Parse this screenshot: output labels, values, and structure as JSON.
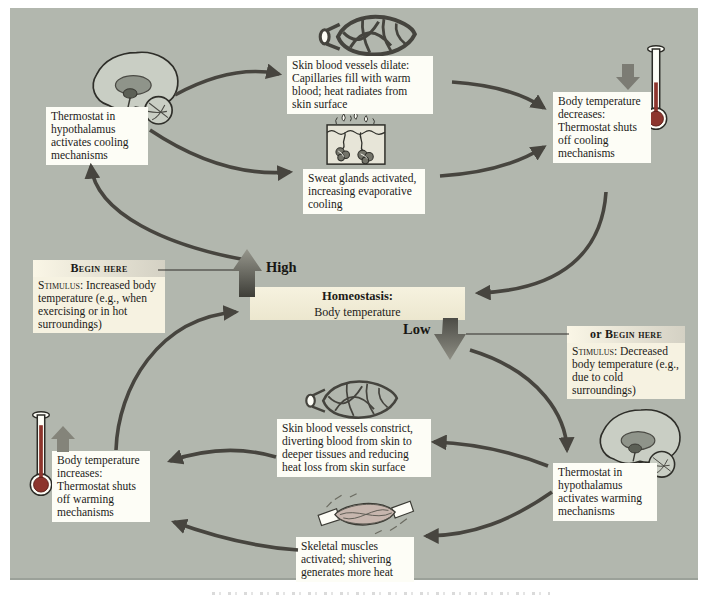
{
  "figure": {
    "topic": "Homeostasis: regulation of body temperature (negative feedback loop)"
  },
  "colors": {
    "panel_bg": "#b2b7ae",
    "white_box_bg": "#fdfdf6",
    "cream_box_bg": "#f6f2e1",
    "curved_arrow": "#47453f",
    "big_arrow_light": "#96968c",
    "big_arrow_dark": "#3e3e38",
    "small_arrow": "#7c7c74",
    "thermometer_mercury": "#8d352d",
    "text": "#1c1b18"
  },
  "nodes": {
    "cooling_thermostat": {
      "text": "Thermostat in hypothalamus activates cooling mechanisms"
    },
    "vessels_dilate": {
      "text": "Skin blood vessels dilate: Capillaries fill with warm blood; heat radiates from skin surface"
    },
    "sweat_glands": {
      "text": "Sweat glands activated, increasing evaporative cooling"
    },
    "temp_decreases": {
      "text": "Body temperature decreases: Thermostat shuts off cooling mechanisms"
    },
    "begin_here": {
      "header": "Begin here",
      "stimulus_label": "Stimulus:",
      "text": " Increased body temperature (e.g., when exercising or in hot surroundings)"
    },
    "homeostasis": {
      "title": "Homeostasis:",
      "subtitle": "Body temperature"
    },
    "high_label": "High",
    "low_label": "Low",
    "or_begin_here": {
      "header_prefix": "or ",
      "header": "Begin here",
      "stimulus_label": "Stimulus:",
      "text": " Decreased body temperature (e.g., due to cold surroundings)"
    },
    "temp_increases": {
      "text": "Body temperature increases: Thermostat shuts off warming mechanisms"
    },
    "vessels_constrict": {
      "text": "Skin blood vessels constrict, diverting blood from skin to deeper tissues and reducing heat loss from skin surface"
    },
    "skeletal_muscles": {
      "text": "Skeletal muscles activated; shivering generates more heat"
    },
    "warming_thermostat": {
      "text": "Thermostat in hypothalamus activates warming mechanisms"
    }
  },
  "icons": [
    "brain-hypothalamus-icon (top left)",
    "dilated-blood-vessel-icon",
    "sweat-gland-icon",
    "thermometer-low-icon with down-arrow",
    "thermometer-high-icon with up-arrow",
    "constricted-blood-vessel-icon",
    "skeletal-muscle-icon",
    "brain-hypothalamus-icon (bottom right)"
  ]
}
